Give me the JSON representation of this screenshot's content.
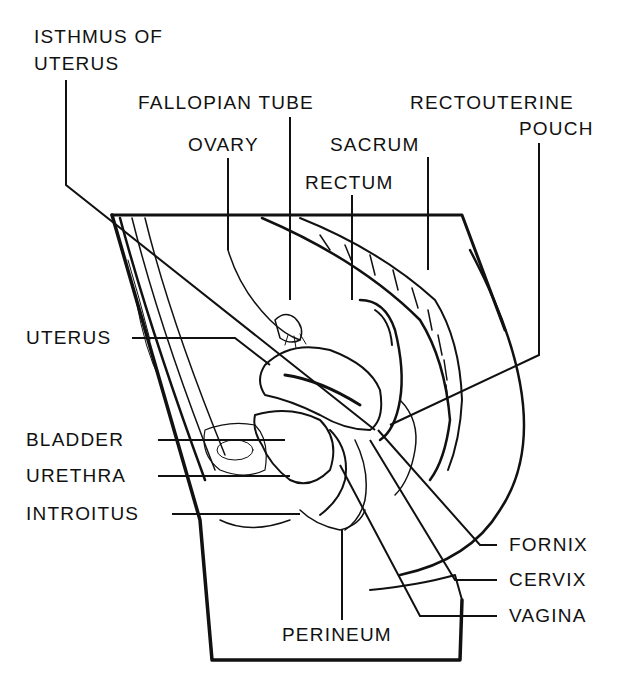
{
  "diagram": {
    "type": "anatomical-sagittal-section",
    "labels": {
      "isthmus_line1": "ISTHMUS OF",
      "isthmus_line2": "UTERUS",
      "fallopian_tube": "FALLOPIAN TUBE",
      "ovary": "OVARY",
      "sacrum": "SACRUM",
      "rectum": "RECTUM",
      "rectouterine_line1": "RECTOUTERINE",
      "rectouterine_line2": "POUCH",
      "uterus": "UTERUS",
      "bladder": "BLADDER",
      "urethra": "URETHRA",
      "introitus": "INTROITUS",
      "fornix": "FORNIX",
      "cervix": "CERVIX",
      "vagina": "VAGINA",
      "perineum": "PERINEUM"
    },
    "colors": {
      "ink": "#111111",
      "background": "#ffffff"
    }
  }
}
